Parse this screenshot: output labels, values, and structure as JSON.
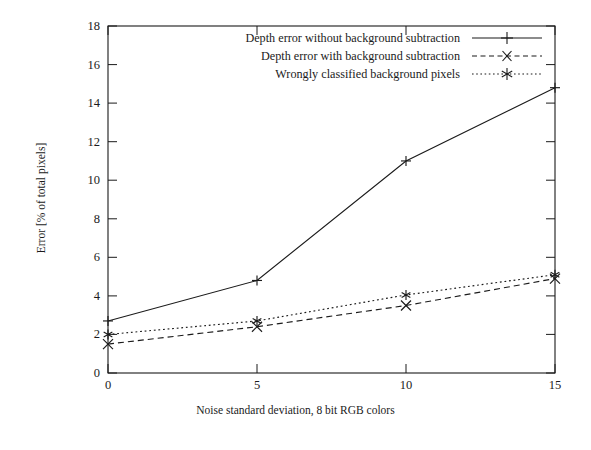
{
  "chart_data": {
    "type": "line",
    "title": "",
    "xlabel": "Noise standard deviation, 8 bit RGB colors",
    "ylabel": "Error [% of total pixels]",
    "x": [
      0,
      5,
      10,
      15
    ],
    "xlim": [
      0,
      15
    ],
    "ylim": [
      0,
      18
    ],
    "xticks": [
      "0",
      "5",
      "10",
      "15"
    ],
    "yticks": [
      "0",
      "2",
      "4",
      "6",
      "8",
      "10",
      "12",
      "14",
      "16",
      "18"
    ],
    "grid": false,
    "legend_position": "top-right inside",
    "series": [
      {
        "name": "Depth error without background subtraction",
        "values": [
          2.7,
          4.8,
          11.0,
          14.8
        ],
        "linestyle": "solid",
        "marker": "plus",
        "color": "#1b1b1b"
      },
      {
        "name": "Depth error with background subtraction",
        "values": [
          1.5,
          2.4,
          3.5,
          4.9
        ],
        "linestyle": "dashed",
        "marker": "cross",
        "color": "#1b1b1b"
      },
      {
        "name": "Wrongly classified background pixels",
        "values": [
          2.0,
          2.7,
          4.05,
          5.1
        ],
        "linestyle": "dotted",
        "marker": "asterisk",
        "color": "#1b1b1b"
      }
    ]
  },
  "axes": {
    "x_title": "Noise standard deviation, 8 bit RGB colors",
    "y_title": "Error [% of total pixels]",
    "y_tick_labels": [
      "18",
      "16",
      "14",
      "12",
      "10",
      "8",
      "6",
      "4",
      "2",
      "0"
    ],
    "x_tick_labels": [
      "0",
      "5",
      "10",
      "15"
    ]
  },
  "legend": {
    "items": [
      {
        "label": "Depth error without background subtraction",
        "key": "solid-line-plus-marker"
      },
      {
        "label": "Depth error with background subtraction",
        "key": "dashed-line-cross-marker"
      },
      {
        "label": "Wrongly classified background pixels",
        "key": "dotted-line-asterisk-marker"
      }
    ]
  },
  "colors": {
    "ink": "#1b1b1b",
    "background": "#ffffff"
  }
}
